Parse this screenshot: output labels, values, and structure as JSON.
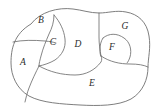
{
  "figure": {
    "kind": "partitioned-region-diagram",
    "background_color": "#ffffff",
    "line_color": "#6f6f6f",
    "label_color": "#2b2b2b",
    "label_style": "italic-serif",
    "region_count": 7,
    "regions": [
      {
        "id": "A",
        "label": "A",
        "position": "left",
        "cx": 23,
        "cy": 63
      },
      {
        "id": "B",
        "label": "B",
        "position": "top-left",
        "cx": 41,
        "cy": 21
      },
      {
        "id": "C",
        "label": "C",
        "position": "center-left",
        "cx": 53,
        "cy": 43
      },
      {
        "id": "D",
        "label": "D",
        "position": "center",
        "cx": 78,
        "cy": 45
      },
      {
        "id": "E",
        "label": "E",
        "position": "bottom",
        "cx": 92,
        "cy": 84
      },
      {
        "id": "F",
        "label": "F",
        "position": "right-middle",
        "cx": 112,
        "cy": 48
      },
      {
        "id": "G",
        "label": "G",
        "position": "top-right",
        "cx": 125,
        "cy": 27
      }
    ]
  }
}
